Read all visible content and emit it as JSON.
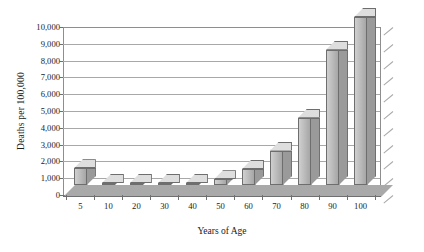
{
  "chart_data": {
    "type": "bar",
    "title": "",
    "xlabel": "Years of Age",
    "ylabel": "Deaths per 100,000",
    "categories": [
      "5",
      "10",
      "20",
      "30",
      "40",
      "50",
      "60",
      "70",
      "80",
      "90",
      "100"
    ],
    "values": [
      1000,
      40,
      45,
      60,
      80,
      350,
      950,
      2050,
      4000,
      8050,
      10000
    ],
    "ylim": [
      0,
      10000
    ],
    "ytick_labels": [
      "0",
      "1,000",
      "2,000",
      "3,000",
      "4,000",
      "5,000",
      "6,000",
      "7,000",
      "8,000",
      "9,000",
      "10,000"
    ],
    "ytick_values": [
      0,
      1000,
      2000,
      3000,
      4000,
      5000,
      6000,
      7000,
      8000,
      9000,
      10000
    ],
    "grid": true,
    "legend": "none",
    "style": "3d-column-grayscale",
    "bar_color": "#bdbdbd",
    "bar_edge_color": "#6e6e6e",
    "grid_color": "#a8a8a8",
    "axis_color": "#6f6f6f",
    "floor_color": "#a9a9a9"
  }
}
